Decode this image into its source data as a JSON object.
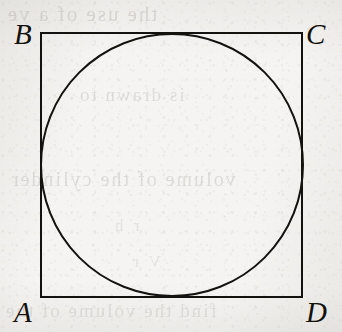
{
  "figure": {
    "type": "geometric-diagram",
    "medium": "scanned-book-page",
    "paper_color": "#f5f4f2",
    "ink_color": "#14120e",
    "stroke_width": 2,
    "shapes": {
      "square": {
        "name": "square-ABCD",
        "x": 41,
        "y": 33,
        "width": 261,
        "height": 264,
        "vertices": {
          "A": {
            "x": 41,
            "y": 297
          },
          "B": {
            "x": 41,
            "y": 33
          },
          "C": {
            "x": 302,
            "y": 33
          },
          "D": {
            "x": 302,
            "y": 297
          }
        }
      },
      "circle": {
        "name": "inscribed-circle",
        "cx": 172,
        "cy": 165,
        "r": 131
      }
    },
    "labels": [
      {
        "id": "B",
        "text": "B",
        "corner": "top-left",
        "x": 14,
        "y": 20
      },
      {
        "id": "C",
        "text": "C",
        "corner": "top-right",
        "x": 306,
        "y": 20
      },
      {
        "id": "A",
        "text": "A",
        "corner": "bottom-left",
        "x": 14,
        "y": 298
      },
      {
        "id": "D",
        "text": "D",
        "corner": "bottom-right",
        "x": 306,
        "y": 298
      }
    ]
  },
  "bleed_through": {
    "description": "faint mirrored show-through text from the reverse side of the page",
    "lines": [
      "the use of a ve",
      "is drawn to",
      "volume of the cylinder",
      "r  h",
      "V  r",
      "find the volume of the"
    ]
  }
}
